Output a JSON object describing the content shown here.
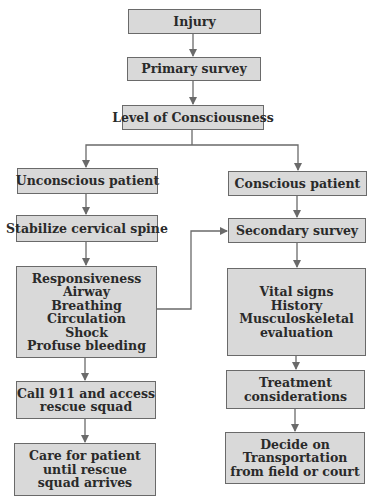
{
  "diagram": {
    "type": "flowchart",
    "colors": {
      "box_fill": "#d9d9d9",
      "box_border": "#6a6a6a",
      "arrow": "#6a6a6a",
      "text": "#2a2a2a"
    },
    "nodes": {
      "injury": {
        "lines": [
          "Injury"
        ]
      },
      "primary_survey": {
        "lines": [
          "Primary survey"
        ]
      },
      "level_of_consciousness": {
        "lines": [
          "Level of Consciousness"
        ]
      },
      "unconscious_patient": {
        "lines": [
          "Unconscious patient"
        ]
      },
      "conscious_patient": {
        "lines": [
          "Conscious patient"
        ]
      },
      "stabilize_cervical_spine": {
        "lines": [
          "Stabilize cervical spine"
        ]
      },
      "secondary_survey": {
        "lines": [
          "Secondary survey"
        ]
      },
      "abc_checks": {
        "lines": [
          "Responsiveness",
          "Airway",
          "Breathing",
          "Circulation",
          "Shock",
          "Profuse bleeding"
        ]
      },
      "vital_signs": {
        "lines": [
          "Vital signs",
          "History",
          "Musculoskeletal",
          "evaluation"
        ]
      },
      "call_911": {
        "lines": [
          "Call 911 and access",
          "rescue squad"
        ]
      },
      "treatment_considerations": {
        "lines": [
          "Treatment",
          "considerations"
        ]
      },
      "care_for_patient": {
        "lines": [
          "Care for patient",
          "until rescue",
          "squad arrives"
        ]
      },
      "decide_transportation": {
        "lines": [
          "Decide on",
          "Transportation",
          "from field or court"
        ]
      }
    },
    "edges": [
      [
        "injury",
        "primary_survey"
      ],
      [
        "primary_survey",
        "level_of_consciousness"
      ],
      [
        "level_of_consciousness",
        "unconscious_patient"
      ],
      [
        "level_of_consciousness",
        "conscious_patient"
      ],
      [
        "unconscious_patient",
        "stabilize_cervical_spine"
      ],
      [
        "stabilize_cervical_spine",
        "abc_checks"
      ],
      [
        "abc_checks",
        "secondary_survey"
      ],
      [
        "abc_checks",
        "call_911"
      ],
      [
        "call_911",
        "care_for_patient"
      ],
      [
        "conscious_patient",
        "secondary_survey"
      ],
      [
        "secondary_survey",
        "vital_signs"
      ],
      [
        "vital_signs",
        "treatment_considerations"
      ],
      [
        "treatment_considerations",
        "decide_transportation"
      ]
    ]
  }
}
